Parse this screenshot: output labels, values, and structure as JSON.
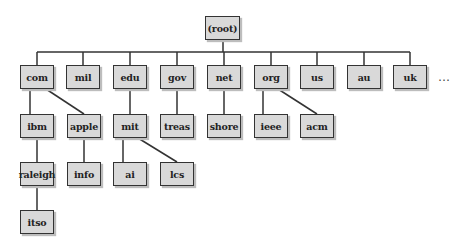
{
  "diagram": {
    "root": "(root)",
    "top_level": [
      "com",
      "mil",
      "edu",
      "gov",
      "net",
      "org",
      "us",
      "au",
      "uk"
    ],
    "more_indicator": "…",
    "nodes": {
      "root": "(root)",
      "com": "com",
      "mil": "mil",
      "edu": "edu",
      "gov": "gov",
      "net": "net",
      "org": "org",
      "us": "us",
      "au": "au",
      "uk": "uk",
      "ibm": "ibm",
      "apple": "apple",
      "mit": "mit",
      "treas": "treas",
      "shore": "shore",
      "ieee": "ieee",
      "acm": "acm",
      "raleigh": "raleigh",
      "info": "info",
      "ai": "ai",
      "lcs": "lcs",
      "itso": "itso"
    },
    "edges": [
      [
        "(root)",
        "com"
      ],
      [
        "(root)",
        "mil"
      ],
      [
        "(root)",
        "edu"
      ],
      [
        "(root)",
        "gov"
      ],
      [
        "(root)",
        "net"
      ],
      [
        "(root)",
        "org"
      ],
      [
        "(root)",
        "us"
      ],
      [
        "(root)",
        "au"
      ],
      [
        "(root)",
        "uk"
      ],
      [
        "com",
        "ibm"
      ],
      [
        "com",
        "apple"
      ],
      [
        "edu",
        "mit"
      ],
      [
        "gov",
        "treas"
      ],
      [
        "net",
        "shore"
      ],
      [
        "org",
        "ieee"
      ],
      [
        "org",
        "acm"
      ],
      [
        "ibm",
        "raleigh"
      ],
      [
        "apple",
        "info"
      ],
      [
        "mit",
        "ai"
      ],
      [
        "mit",
        "lcs"
      ],
      [
        "raleigh",
        "itso"
      ]
    ],
    "colors": {
      "box_fill": "#d9d9d9",
      "box_border": "#333333",
      "line": "#333333",
      "shadow": "#bdbdbd"
    }
  }
}
